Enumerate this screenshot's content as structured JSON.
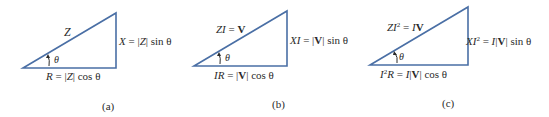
{
  "figure": {
    "line_color": "#4a6fa5",
    "panels": [
      {
        "id": "a",
        "caption": "(a)",
        "hypotenuse_label": {
          "text": "Z"
        },
        "vertical_label": {
          "lhs": "X",
          "eq": " = |",
          "var": "Z",
          "rhs": "| sin θ"
        },
        "base_label": {
          "lhs": "R",
          "eq": " = |",
          "var": "Z",
          "rhs": "| cos θ"
        },
        "angle_label": "θ"
      },
      {
        "id": "b",
        "caption": "(b)",
        "hypotenuse_label": {
          "lhs": "ZI",
          "eq": " = ",
          "rhs": "V"
        },
        "vertical_label": {
          "lhs": "XI",
          "eq": " = |",
          "var": "V",
          "rhs": "| sin θ"
        },
        "base_label": {
          "lhs": "IR",
          "eq": " = |",
          "var": "V",
          "rhs": "| cos θ"
        },
        "angle_label": "θ"
      },
      {
        "id": "c",
        "caption": "(c)",
        "hypotenuse_label": {
          "lhs": "ZI",
          "sup": "2",
          "eq": " = ",
          "i": "I",
          "rhs": "V"
        },
        "vertical_label": {
          "lhs": "XI",
          "sup": "2",
          "eq": " = ",
          "i": "I",
          "bar1": "|",
          "var": "V",
          "rhs": "| sin θ"
        },
        "base_label": {
          "lhs": "I",
          "sup": "2",
          "lhs2": "R",
          "eq": " = ",
          "i": "I",
          "bar1": "|",
          "var": "V",
          "rhs": "| cos θ"
        },
        "angle_label": "θ"
      }
    ]
  }
}
